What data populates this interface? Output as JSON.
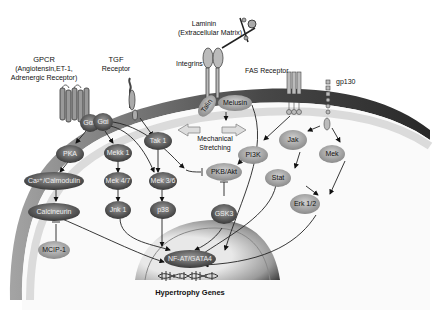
{
  "receptors": {
    "gpcr": {
      "title": "GPCR",
      "line2": "(Angiotensin,ET-1,",
      "line3": "Adrenergic Receptor)"
    },
    "tgf": {
      "title": "TGF",
      "line2": "Receptor"
    },
    "laminin": {
      "title": "Laminin",
      "line2": "(Extracellular Matrix)"
    },
    "integrins": {
      "title": "Integrins"
    },
    "fas": {
      "title": "FAS Receptor"
    },
    "gp130": {
      "title": "gp130"
    }
  },
  "mechanical": {
    "line1": "Mechanical",
    "line2": "Stretching"
  },
  "nodes": {
    "gaq": "Gαq",
    "gai": "Gαi",
    "pka": "PKA",
    "ca": "Ca²⁺/Calmodulin",
    "calcineurin": "Calcineurin",
    "mcip": "MCIP-1",
    "mekk1": "Mekk 1",
    "mek47": "Mek 4/7",
    "jnk1": "Jnk 1",
    "tak1": "Tak 1",
    "mek36": "Mek 3/6",
    "p38": "p38",
    "talin": "Talin",
    "melusin": "Melusin",
    "pkb": "PKB/Akt",
    "gsk3": "GSK3",
    "pi3k": "PI3K",
    "jak": "Jak",
    "stat": "Stat",
    "mek": "Mek",
    "erk": "Erk 1/2",
    "nfat": "NF-AT/GATA4"
  },
  "footer": {
    "genes": "Hypertrophy Genes"
  },
  "colors": {
    "cell": "#d8d8d8",
    "membrane_dark": "#1a1a1a",
    "node_dark": "#555555",
    "node_light": "#aaaaaa"
  }
}
